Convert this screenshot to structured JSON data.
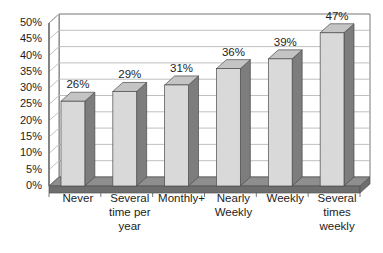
{
  "chart_data": {
    "type": "bar",
    "title": "",
    "subtitle": "",
    "xlabel": "",
    "ylabel": "",
    "categories": [
      "Never",
      "Several time per year",
      "Monthly+",
      "Nearly Weekly",
      "Weekly",
      "Several times weekly"
    ],
    "category_lines": [
      [
        "Never"
      ],
      [
        "Several",
        "time per",
        "year"
      ],
      [
        "Monthly+"
      ],
      [
        "Nearly",
        "Weekly"
      ],
      [
        "Weekly"
      ],
      [
        "Several",
        "times",
        "weekly"
      ]
    ],
    "values": [
      26,
      29,
      31,
      36,
      39,
      47
    ],
    "value_labels": [
      "26%",
      "29%",
      "31%",
      "36%",
      "39%",
      "47%"
    ],
    "ylim": [
      0,
      50
    ],
    "ytick_values": [
      0,
      5,
      10,
      15,
      20,
      25,
      30,
      35,
      40,
      45,
      50
    ],
    "ytick_labels": [
      "0%",
      "5%",
      "10%",
      "15%",
      "20%",
      "25%",
      "30%",
      "35%",
      "40%",
      "45%",
      "50%"
    ],
    "grid": true,
    "grid_axis": "y",
    "legend": false,
    "legend_position": "none",
    "style": "3d-column",
    "colors": {
      "bar_front": "#d9d9d9",
      "bar_side": "#7d7d7d",
      "bar_top": "#c4c4c4",
      "floor": "#6e6e6e",
      "floor_top": "#8e8e8e",
      "gridline": "#b9b9b9",
      "axis": "#555555",
      "plot_background": "#ffffff",
      "page_background": "#ffffff",
      "text": "#1d1d1d"
    }
  }
}
